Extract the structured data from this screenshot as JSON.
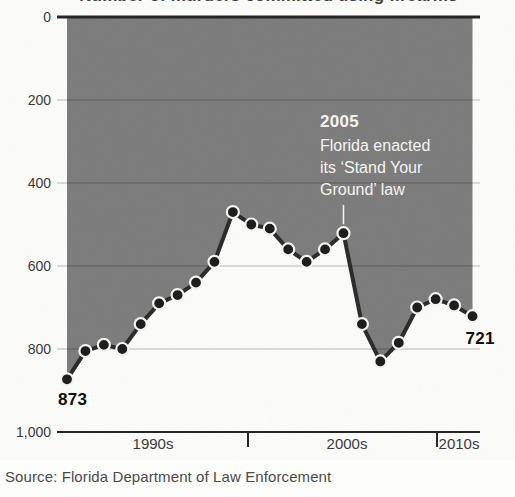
{
  "header": {
    "clipped_subtitle": "Number of murders committed using firearms"
  },
  "chart_data": {
    "type": "area",
    "title": "Number of murders committed using firearms",
    "xlabel": "",
    "ylabel": "",
    "x": [
      1990,
      1991,
      1992,
      1993,
      1994,
      1995,
      1996,
      1997,
      1998,
      1999,
      2000,
      2001,
      2002,
      2003,
      2004,
      2005,
      2006,
      2007,
      2008,
      2009,
      2010,
      2011,
      2012
    ],
    "values": [
      873,
      805,
      790,
      800,
      740,
      690,
      670,
      640,
      590,
      470,
      500,
      510,
      560,
      590,
      560,
      521,
      740,
      830,
      785,
      700,
      680,
      695,
      721
    ],
    "ylim": [
      0,
      1000
    ],
    "y_axis_inverted": true,
    "grid": true,
    "ytick_values": [
      0,
      200,
      400,
      600,
      800,
      1000
    ],
    "ytick_labels": [
      "0",
      "200",
      "400",
      "600",
      "800",
      "1,000"
    ],
    "xtick_labels": [
      "1990s",
      "2000s",
      "2010s"
    ],
    "annotations": {
      "start_label": "873",
      "end_label": "721",
      "event": {
        "year": 2005,
        "year_label": "2005",
        "text_lines": [
          "Florida enacted",
          "its ‘Stand Your",
          "Ground’ law"
        ]
      }
    }
  },
  "footer": {
    "source": "Source: Florida Department of Law Enforcement"
  },
  "colors": {
    "background": "#fdfdfb",
    "area_fill": "#7c7c7c",
    "line": "#2c2c2c",
    "dot": "#1e1e1e",
    "dot_ring": "#f2f2f0",
    "grid_overlay": "rgba(0,0,0,0.18)",
    "axis": "#262626",
    "axis_label": "#3a3a3a",
    "annotation_text": "#f4f4f2",
    "pointer_line": "rgba(255,255,255,0.9)",
    "value_label": "#101010",
    "source_text": "#4b4b4b"
  }
}
